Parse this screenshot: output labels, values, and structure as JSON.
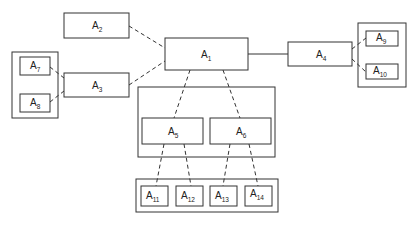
{
  "diagram": {
    "type": "hierarchy",
    "nodes": [
      {
        "id": "A1",
        "label": "A",
        "sub": "1"
      },
      {
        "id": "A2",
        "label": "A",
        "sub": "2"
      },
      {
        "id": "A3",
        "label": "A",
        "sub": "3"
      },
      {
        "id": "A4",
        "label": "A",
        "sub": "4"
      },
      {
        "id": "A5",
        "label": "A",
        "sub": "5"
      },
      {
        "id": "A6",
        "label": "A",
        "sub": "6"
      },
      {
        "id": "A7",
        "label": "A",
        "sub": "7"
      },
      {
        "id": "A8",
        "label": "A",
        "sub": "8"
      },
      {
        "id": "A9",
        "label": "A",
        "sub": "9"
      },
      {
        "id": "A10",
        "label": "A",
        "sub": "10"
      },
      {
        "id": "A11",
        "label": "A",
        "sub": "11"
      },
      {
        "id": "A12",
        "label": "A",
        "sub": "12"
      },
      {
        "id": "A13",
        "label": "A",
        "sub": "13"
      },
      {
        "id": "A14",
        "label": "A",
        "sub": "14"
      }
    ],
    "groups": [
      {
        "id": "left-group",
        "members": [
          "A7",
          "A8"
        ]
      },
      {
        "id": "right-group",
        "members": [
          "A9",
          "A10"
        ]
      },
      {
        "id": "middle-group",
        "members": [
          "A5",
          "A6"
        ]
      },
      {
        "id": "bottom-group",
        "members": [
          "A11",
          "A12",
          "A13",
          "A14"
        ]
      }
    ],
    "edges": [
      {
        "from": "A1",
        "to": "A2",
        "style": "dashed"
      },
      {
        "from": "A1",
        "to": "A3",
        "style": "dashed"
      },
      {
        "from": "A1",
        "to": "A4",
        "style": "solid"
      },
      {
        "from": "A1",
        "to": "A5",
        "style": "dashed"
      },
      {
        "from": "A1",
        "to": "A6",
        "style": "dashed"
      },
      {
        "from": "A3",
        "to": "A7",
        "style": "dashed"
      },
      {
        "from": "A3",
        "to": "A8",
        "style": "dashed"
      },
      {
        "from": "A4",
        "to": "A9",
        "style": "dashed"
      },
      {
        "from": "A4",
        "to": "A10",
        "style": "dashed"
      },
      {
        "from": "A5",
        "to": "A11",
        "style": "dashed"
      },
      {
        "from": "A5",
        "to": "A12",
        "style": "dashed"
      },
      {
        "from": "A6",
        "to": "A13",
        "style": "dashed"
      },
      {
        "from": "A6",
        "to": "A14",
        "style": "dashed"
      }
    ]
  },
  "colors": {
    "stroke": "#333333",
    "background": "#ffffff"
  }
}
